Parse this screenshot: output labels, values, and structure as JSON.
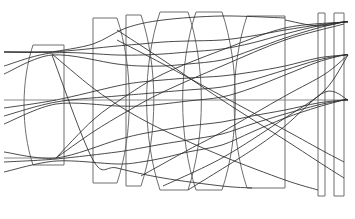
{
  "figure": {
    "type": "optical-layout-diagram",
    "width": 355,
    "height": 219,
    "background_color": "#ffffff",
    "lens_stroke_color": "#6e6e6e",
    "ray_stroke_color": "#2b2b2b",
    "axis_stroke_color": "#7a7a7a",
    "element_count": 8,
    "ray_bundle_count": 3,
    "rays_per_bundle": 3
  },
  "chart_data": {
    "type": "line",
    "xlabel": "",
    "ylabel": "",
    "xlim": [
      0,
      355
    ],
    "ylim": [
      219,
      0
    ],
    "grid": false,
    "legend": "none",
    "optical_axis_y": 100,
    "image_plane_x": 348,
    "object_side": "left",
    "image_side": "right",
    "focus_points": [
      {
        "name": "focus-upper-field",
        "x": 348,
        "y": 22
      },
      {
        "name": "focus-mid-field",
        "x": 348,
        "y": 55
      },
      {
        "name": "focus-axial",
        "x": 348,
        "y": 100
      }
    ],
    "entrance_heights": [
      52,
      100,
      158
    ],
    "elements": [
      {
        "name": "element-1-front-meniscus",
        "index": 1,
        "shape": "meniscus",
        "x_front": 33,
        "x_rear": 64,
        "y_top": 45,
        "y_bottom": 165,
        "front_curved": true,
        "rear_curved": false,
        "path": "M 62 45 L 48 45 C 33 72 33 132 50 163 L 62 163 L 62 45 Z"
      },
      {
        "name": "element-2-thick-positive",
        "index": 2,
        "shape": "plano-convex-thick",
        "x_front": 93,
        "x_rear": 117,
        "y_top": 18,
        "y_bottom": 183,
        "front_curved": false,
        "rear_curved": true,
        "path": "M 93 18 L 117 18 L 117 183 L 93 183 L 93 160 C 107 125 107 60 95 42 L 93 18 Z"
      },
      {
        "name": "element-3-thin-meniscus",
        "index": 3,
        "shape": "meniscus-thin",
        "x_front": 126,
        "x_rear": 141,
        "y_top": 15,
        "y_bottom": 186,
        "front_curved": false,
        "rear_curved": true,
        "path": "M 126 15 L 141 15 L 141 186 L 126 186 L 126 15 Z"
      },
      {
        "name": "element-4-biconvex",
        "index": 4,
        "shape": "biconvex-thick",
        "x_front": 160,
        "x_rear": 188,
        "y_top": 12,
        "y_bottom": 190,
        "front_curved": true,
        "rear_curved": true,
        "path": "M 163 12 L 188 12 L 188 190 L 163 190 Z"
      },
      {
        "name": "element-5-biconcave",
        "index": 5,
        "shape": "biconcave",
        "x_front": 196,
        "x_rear": 222,
        "y_top": 12,
        "y_bottom": 190,
        "front_curved": true,
        "rear_curved": true,
        "path": "M 196 12 L 222 12 L 222 190 L 196 190 Z"
      },
      {
        "name": "element-6-rear-positive",
        "index": 6,
        "shape": "plano-convex",
        "x_front": 247,
        "x_rear": 285,
        "y_top": 16,
        "y_bottom": 188,
        "front_curved": true,
        "rear_curved": false,
        "path": "M 252 16 L 285 16 L 285 188 L 252 188 Z"
      },
      {
        "name": "element-7-filter-plate",
        "index": 7,
        "shape": "plane-parallel-plate",
        "x_front": 318,
        "x_rear": 325,
        "y_top": 13,
        "y_bottom": 196,
        "front_curved": false,
        "rear_curved": false,
        "path": "M 318 13 L 325 13 L 325 196 L 318 196 Z"
      },
      {
        "name": "element-8-cover-plate",
        "index": 8,
        "shape": "plane-parallel-plate",
        "x_front": 334,
        "x_rear": 344,
        "y_top": 13,
        "y_bottom": 196,
        "front_curved": false,
        "rear_curved": false,
        "path": "M 334 13 L 344 13 L 344 196 L 334 196 Z"
      }
    ],
    "axis_segments": [
      {
        "name": "axis-upper-entry",
        "x1": 4,
        "y1": 52,
        "x2": 52,
        "y2": 52
      },
      {
        "name": "axis-optical-entry",
        "x1": 4,
        "y1": 100,
        "x2": 56,
        "y2": 100
      },
      {
        "name": "axis-lower-entry",
        "x1": 4,
        "y1": 158,
        "x2": 56,
        "y2": 158
      },
      {
        "name": "axis-mid-internal",
        "x1": 62,
        "y1": 100,
        "x2": 348,
        "y2": 100
      }
    ],
    "ray_bundles": [
      {
        "name": "bundle-upper-field",
        "entry_height": 52,
        "focus": {
          "x": 348,
          "y": 22
        },
        "rays": [
          {
            "name": "ray-u1",
            "points": [
              [
                4,
                52
              ],
              [
                52,
                52
              ],
              [
                117,
                46
              ],
              [
                141,
                44
              ],
              [
                163,
                42
              ],
              [
                188,
                41
              ],
              [
                222,
                40
              ],
              [
                252,
                36
              ],
              [
                285,
                30
              ],
              [
                318,
                25
              ],
              [
                344,
                22
              ],
              [
                348,
                22
              ]
            ]
          },
          {
            "name": "ray-u2",
            "points": [
              [
                4,
                66
              ],
              [
                52,
                53
              ],
              [
                117,
                55
              ],
              [
                141,
                55
              ],
              [
                163,
                54
              ],
              [
                188,
                52
              ],
              [
                222,
                49
              ],
              [
                252,
                43
              ],
              [
                285,
                34
              ],
              [
                318,
                26
              ],
              [
                344,
                22
              ],
              [
                348,
                22
              ]
            ]
          },
          {
            "name": "ray-u3",
            "points": [
              [
                4,
                74
              ],
              [
                52,
                55
              ],
              [
                117,
                64
              ],
              [
                141,
                66
              ],
              [
                163,
                66
              ],
              [
                188,
                64
              ],
              [
                222,
                60
              ],
              [
                252,
                50
              ],
              [
                285,
                38
              ],
              [
                318,
                28
              ],
              [
                344,
                22
              ],
              [
                348,
                22
              ]
            ]
          }
        ]
      },
      {
        "name": "bundle-mid-field",
        "entry_height": 100,
        "focus": {
          "x": 348,
          "y": 55
        },
        "rays": [
          {
            "name": "ray-m1",
            "points": [
              [
                4,
                108
              ],
              [
                56,
                100
              ],
              [
                117,
                86
              ],
              [
                141,
                82
              ],
              [
                163,
                80
              ],
              [
                188,
                78
              ],
              [
                222,
                76
              ],
              [
                252,
                72
              ],
              [
                285,
                66
              ],
              [
                318,
                58
              ],
              [
                344,
                55
              ],
              [
                348,
                55
              ]
            ]
          },
          {
            "name": "ray-m2",
            "points": [
              [
                4,
                116
              ],
              [
                56,
                102
              ],
              [
                117,
                96
              ],
              [
                141,
                94
              ],
              [
                163,
                92
              ],
              [
                188,
                90
              ],
              [
                222,
                87
              ],
              [
                252,
                80
              ],
              [
                285,
                70
              ],
              [
                318,
                60
              ],
              [
                344,
                55
              ],
              [
                348,
                55
              ]
            ]
          },
          {
            "name": "ray-m3",
            "points": [
              [
                4,
                124
              ],
              [
                56,
                104
              ],
              [
                117,
                106
              ],
              [
                141,
                106
              ],
              [
                163,
                104
              ],
              [
                188,
                101
              ],
              [
                222,
                97
              ],
              [
                252,
                88
              ],
              [
                285,
                75
              ],
              [
                318,
                62
              ],
              [
                344,
                55
              ],
              [
                348,
                55
              ]
            ]
          }
        ]
      },
      {
        "name": "bundle-axial",
        "entry_height": 158,
        "focus": {
          "x": 348,
          "y": 100
        },
        "rays": [
          {
            "name": "ray-a1",
            "points": [
              [
                4,
                152
              ],
              [
                56,
                158
              ],
              [
                117,
                140
              ],
              [
                141,
                134
              ],
              [
                163,
                130
              ],
              [
                188,
                126
              ],
              [
                222,
                122
              ],
              [
                252,
                116
              ],
              [
                285,
                110
              ],
              [
                318,
                103
              ],
              [
                344,
                100
              ],
              [
                348,
                100
              ]
            ]
          },
          {
            "name": "ray-a2",
            "points": [
              [
                4,
                162
              ],
              [
                56,
                159
              ],
              [
                117,
                152
              ],
              [
                141,
                148
              ],
              [
                163,
                144
              ],
              [
                188,
                140
              ],
              [
                222,
                134
              ],
              [
                252,
                124
              ],
              [
                285,
                114
              ],
              [
                318,
                105
              ],
              [
                344,
                100
              ],
              [
                348,
                100
              ]
            ]
          },
          {
            "name": "ray-a3",
            "points": [
              [
                4,
                172
              ],
              [
                56,
                161
              ],
              [
                117,
                164
              ],
              [
                141,
                162
              ],
              [
                163,
                158
              ],
              [
                188,
                152
              ],
              [
                222,
                145
              ],
              [
                252,
                132
              ],
              [
                285,
                118
              ],
              [
                318,
                107
              ],
              [
                344,
                100
              ],
              [
                348,
                100
              ]
            ]
          }
        ]
      }
    ],
    "crossing_rays": [
      {
        "name": "cross-ray-1",
        "points": [
          [
            52,
            55
          ],
          [
            93,
            160
          ],
          [
            117,
            168
          ],
          [
            163,
            178
          ],
          [
            222,
            186
          ],
          [
            252,
            188
          ]
        ]
      },
      {
        "name": "cross-ray-2",
        "points": [
          [
            52,
            52
          ],
          [
            93,
            44
          ],
          [
            126,
            28
          ],
          [
            163,
            20
          ],
          [
            222,
            16
          ],
          [
            285,
            18
          ]
        ]
      },
      {
        "name": "cross-ray-3",
        "points": [
          [
            56,
            158
          ],
          [
            93,
            120
          ],
          [
            126,
            96
          ],
          [
            163,
            74
          ],
          [
            222,
            50
          ],
          [
            285,
            28
          ],
          [
            344,
            22
          ]
        ]
      },
      {
        "name": "cross-ray-4",
        "points": [
          [
            56,
            158
          ],
          [
            93,
            132
          ],
          [
            126,
            112
          ],
          [
            163,
            92
          ],
          [
            222,
            66
          ],
          [
            285,
            40
          ],
          [
            344,
            24
          ]
        ]
      },
      {
        "name": "cross-ray-5",
        "points": [
          [
            52,
            54
          ],
          [
            93,
            88
          ],
          [
            126,
            110
          ],
          [
            163,
            130
          ],
          [
            222,
            156
          ],
          [
            285,
            180
          ],
          [
            318,
            190
          ]
        ]
      },
      {
        "name": "cross-ray-6",
        "points": [
          [
            117,
            30
          ],
          [
            163,
            60
          ],
          [
            222,
            100
          ],
          [
            285,
            140
          ],
          [
            325,
            166
          ],
          [
            344,
            178
          ]
        ]
      },
      {
        "name": "cross-ray-7",
        "points": [
          [
            117,
            40
          ],
          [
            163,
            64
          ],
          [
            222,
            96
          ],
          [
            285,
            130
          ],
          [
            325,
            152
          ],
          [
            344,
            162
          ]
        ]
      },
      {
        "name": "cross-ray-8",
        "points": [
          [
            141,
            176
          ],
          [
            188,
            150
          ],
          [
            222,
            132
          ],
          [
            285,
            96
          ],
          [
            325,
            74
          ],
          [
            348,
            55
          ]
        ]
      },
      {
        "name": "cross-ray-9",
        "points": [
          [
            163,
            186
          ],
          [
            222,
            158
          ],
          [
            285,
            118
          ],
          [
            325,
            90
          ],
          [
            348,
            55
          ]
        ]
      },
      {
        "name": "cross-ray-10",
        "points": [
          [
            188,
            190
          ],
          [
            252,
            150
          ],
          [
            285,
            126
          ],
          [
            325,
            92
          ],
          [
            348,
            100
          ]
        ]
      },
      {
        "name": "cross-ray-11",
        "points": [
          [
            285,
            20
          ],
          [
            318,
            26
          ],
          [
            344,
            22
          ],
          [
            348,
            22
          ]
        ]
      },
      {
        "name": "cross-ray-12",
        "points": [
          [
            4,
            52
          ],
          [
            52,
            52
          ]
        ]
      }
    ]
  }
}
